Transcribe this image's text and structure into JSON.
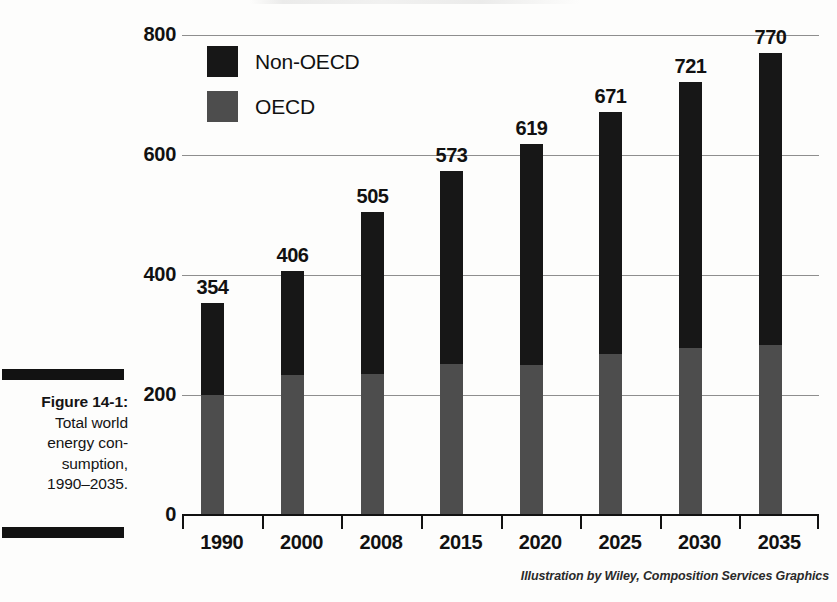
{
  "figure": {
    "caption_lines": [
      "Figure 14-1:",
      "Total world",
      "energy con-",
      "sumption,",
      "1990–2035."
    ],
    "caption_label": "Figure 14-1:",
    "credit": "Illustration by Wiley, Composition Services Graphics"
  },
  "colors": {
    "non_oecd": "#171717",
    "oecd": "#4d4d4d",
    "gridline": "#8e8e8e",
    "axis": "#111111",
    "background": "#fdfdfc"
  },
  "chart_data": {
    "type": "bar",
    "subtype": "stacked-vertical",
    "xlabel": "",
    "ylabel": "",
    "ylim": [
      0,
      800
    ],
    "yticks": [
      0,
      200,
      400,
      600,
      800
    ],
    "ytick_labels": [
      "0",
      "200",
      "400",
      "600",
      "800"
    ],
    "grid": true,
    "grid_axis": "y",
    "legend_position": "top-left-inside",
    "categories": [
      "1990",
      "2000",
      "2008",
      "2015",
      "2020",
      "2025",
      "2030",
      "2035"
    ],
    "series": [
      {
        "name": "OECD",
        "color": "#4d4d4d",
        "values": [
          200,
          232,
          235,
          251,
          251,
          267,
          278,
          283
        ]
      },
      {
        "name": "Non-OECD",
        "color": "#171717",
        "values": [
          154,
          174,
          270,
          322,
          368,
          404,
          443,
          487
        ]
      }
    ],
    "stack_order_bottom_to_top": [
      "OECD",
      "Non-OECD"
    ],
    "totals": [
      354,
      406,
      505,
      573,
      619,
      671,
      721,
      770
    ],
    "total_labels": [
      "354",
      "406",
      "505",
      "573",
      "619",
      "671",
      "721",
      "770"
    ],
    "annotations": [
      "Data labels show the stacked total above each bar"
    ]
  },
  "legend": {
    "items": [
      {
        "label": "Non-OECD",
        "swatch": "non-oecd-swatch"
      },
      {
        "label": "OECD",
        "swatch": "oecd-swatch"
      }
    ]
  }
}
